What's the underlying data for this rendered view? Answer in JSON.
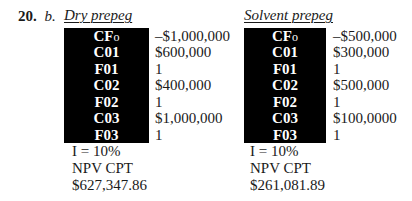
{
  "problem": {
    "number": "20.",
    "part": "b."
  },
  "dry_prepeg": {
    "title": "Dry prepeg",
    "keys": [
      {
        "main": "CF",
        "sub": "o"
      },
      {
        "main": "C01",
        "sub": ""
      },
      {
        "main": "F01",
        "sub": ""
      },
      {
        "main": "C02",
        "sub": ""
      },
      {
        "main": "F02",
        "sub": ""
      },
      {
        "main": "C03",
        "sub": ""
      },
      {
        "main": "F03",
        "sub": ""
      }
    ],
    "values": [
      "–$1,000,000",
      "$600,000",
      "1",
      "$400,000",
      "1",
      "$1,000,000",
      "1"
    ],
    "interest": "I = 10%",
    "npv_label": "NPV CPT",
    "npv_value": "$627,347.86"
  },
  "solvent_prepeg": {
    "title": "Solvent prepeg",
    "keys": [
      {
        "main": "CF",
        "sub": "o"
      },
      {
        "main": "C01",
        "sub": ""
      },
      {
        "main": "F01",
        "sub": ""
      },
      {
        "main": "C02",
        "sub": ""
      },
      {
        "main": "F02",
        "sub": ""
      },
      {
        "main": "C03",
        "sub": ""
      },
      {
        "main": "F03",
        "sub": ""
      }
    ],
    "values": [
      "–$500,000",
      "$300,000",
      "1",
      "$500,000",
      "1",
      "$100,0000",
      "1"
    ],
    "interest": "I = 10%",
    "npv_label": "NPV CPT",
    "npv_value": "$261,081.89"
  }
}
